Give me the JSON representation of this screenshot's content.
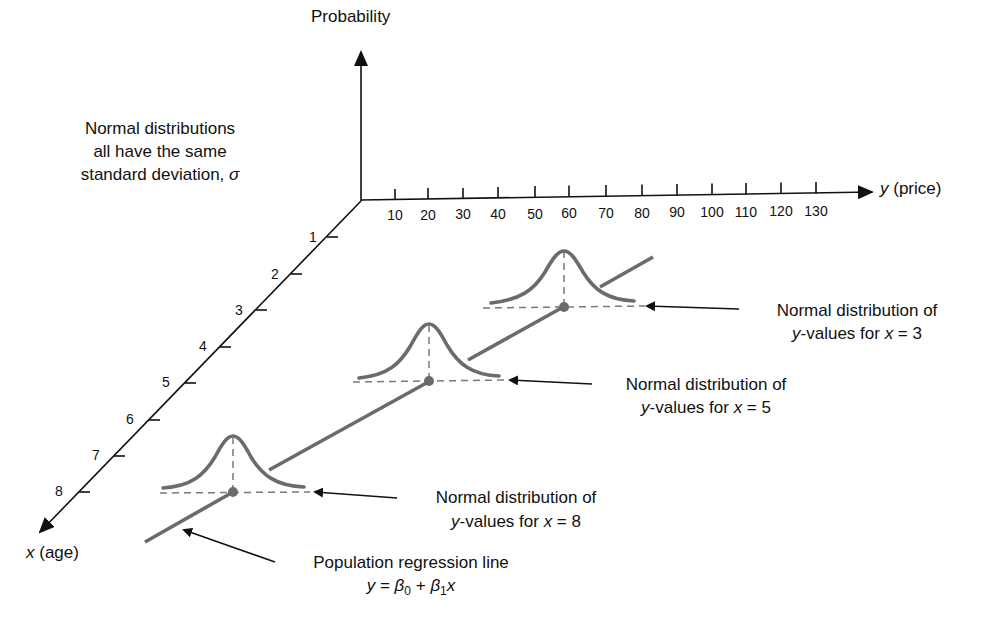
{
  "figure": {
    "z_axis_label": "Probability",
    "y_axis_label_var": "y",
    "y_axis_label_rest": " (price)",
    "x_axis_label_var": "x",
    "x_axis_label_rest": " (age)",
    "note_lines": [
      "Normal distributions",
      "all have the same",
      "standard deviation, "
    ],
    "note_sigma": "σ",
    "y_ticks": [
      "10",
      "20",
      "30",
      "40",
      "50",
      "60",
      "70",
      "80",
      "90",
      "100",
      "110",
      "120",
      "130"
    ],
    "x_ticks": [
      "1",
      "2",
      "3",
      "4",
      "5",
      "6",
      "7",
      "8"
    ],
    "annotations": [
      {
        "line1": "Normal distribution of",
        "line2_var": "y",
        "line2_mid": "-values for ",
        "line2_var2": "x",
        "line2_end": " = 3"
      },
      {
        "line1": "Normal distribution of",
        "line2_var": "y",
        "line2_mid": "-values for ",
        "line2_var2": "x",
        "line2_end": " = 5"
      },
      {
        "line1": "Normal distribution of",
        "line2_var": "y",
        "line2_mid": "-values for ",
        "line2_var2": "x",
        "line2_end": " = 8"
      }
    ],
    "regression": {
      "line1": "Population regression line",
      "eq_y": "y",
      "eq_eq": " = ",
      "eq_b0": "β",
      "eq_b0_sub": "0",
      "eq_plus": " + ",
      "eq_b1": "β",
      "eq_b1_sub": "1",
      "eq_x": "x"
    },
    "colors": {
      "axis": "#111111",
      "curve": "#6b6b6b",
      "dash": "#7a7a7a",
      "background": "#ffffff"
    }
  }
}
